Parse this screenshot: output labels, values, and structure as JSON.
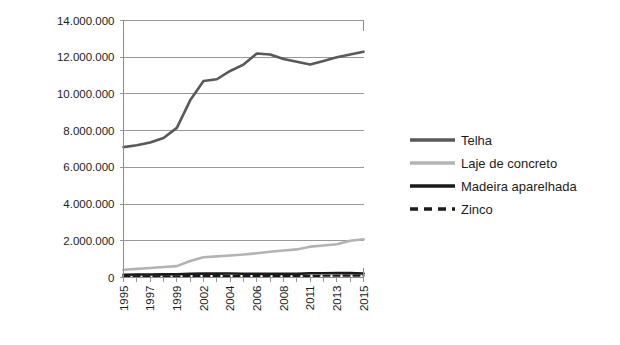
{
  "chart_data": {
    "type": "line",
    "title": "",
    "xlabel": "",
    "ylabel": "",
    "ylim": [
      0,
      14000000
    ],
    "ytick_step": 2000000,
    "grid": true,
    "legend_position": "right",
    "ytick_labels": [
      "14.000.000",
      "12.000.000",
      "10.000.000",
      "8.000.000",
      "6.000.000",
      "4.000.000",
      "2.000.000",
      "0"
    ],
    "ytick_values": [
      14000000,
      12000000,
      10000000,
      8000000,
      6000000,
      4000000,
      2000000,
      0
    ],
    "x": [
      1995,
      1996,
      1997,
      1998,
      1999,
      2001,
      2002,
      2003,
      2004,
      2005,
      2006,
      2007,
      2008,
      2009,
      2011,
      2012,
      2013,
      2014,
      2015
    ],
    "xtick_labels": [
      "1995",
      "1997",
      "1999",
      "2002",
      "2004",
      "2006",
      "2008",
      "2011",
      "2013",
      "2015"
    ],
    "xtick_label_rotation": -90,
    "series": [
      {
        "name": "Telha",
        "color": "#595959",
        "style": "solid",
        "width": 2.6,
        "values": [
          7100000,
          7200000,
          7350000,
          7600000,
          8150000,
          9650000,
          10700000,
          10800000,
          11250000,
          11600000,
          12200000,
          12150000,
          11900000,
          11750000,
          11600000,
          11800000,
          12000000,
          12150000,
          12300000
        ]
      },
      {
        "name": "Laje de concreto",
        "color": "#b3b3b3",
        "style": "solid",
        "width": 2.6,
        "values": [
          420000,
          470000,
          520000,
          570000,
          620000,
          900000,
          1100000,
          1150000,
          1200000,
          1250000,
          1320000,
          1400000,
          1470000,
          1530000,
          1680000,
          1740000,
          1810000,
          2000000,
          2080000
        ]
      },
      {
        "name": "Madeira aparelhada",
        "color": "#1a1a1a",
        "style": "solid",
        "width": 2.6,
        "values": [
          150000,
          160000,
          165000,
          170000,
          175000,
          200000,
          215000,
          210000,
          215000,
          205000,
          200000,
          195000,
          195000,
          200000,
          235000,
          230000,
          245000,
          240000,
          215000
        ]
      },
      {
        "name": "Zinco",
        "color": "#1a1a1a",
        "style": "dashed",
        "width": 2.2,
        "values": [
          60000,
          62000,
          64000,
          66000,
          68000,
          72000,
          75000,
          76000,
          78000,
          80000,
          82000,
          84000,
          86000,
          88000,
          92000,
          94000,
          96000,
          98000,
          100000
        ]
      }
    ]
  },
  "legend": {
    "items": [
      {
        "label": "Telha"
      },
      {
        "label": "Laje de concreto"
      },
      {
        "label": "Madeira aparelhada"
      },
      {
        "label": "Zinco"
      }
    ]
  }
}
